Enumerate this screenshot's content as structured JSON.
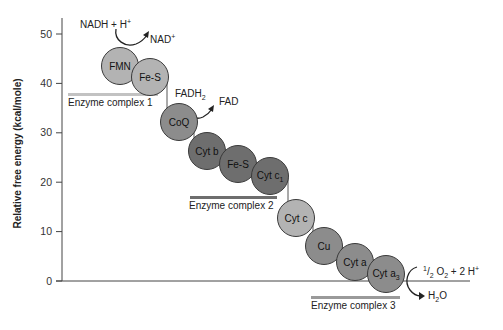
{
  "diagram": {
    "y_axis": {
      "label": "Relative free energy (kcal/mole)",
      "ticks": [
        "0",
        "10",
        "20",
        "30",
        "40",
        "50"
      ],
      "range": [
        0,
        50
      ]
    },
    "carriers": [
      {
        "id": "fmn",
        "label": "FMN",
        "shade": "light"
      },
      {
        "id": "fes1",
        "label": "Fe-S",
        "shade": "light"
      },
      {
        "id": "coq",
        "label": "CoQ",
        "shade": "mid"
      },
      {
        "id": "cytb",
        "label": "Cyt b",
        "shade": "dark"
      },
      {
        "id": "fes2",
        "label": "Fe-S",
        "shade": "dark"
      },
      {
        "id": "cytc1",
        "label": "Cyt c",
        "sub": "1",
        "shade": "dark"
      },
      {
        "id": "cytc",
        "label": "Cyt c",
        "shade": "light"
      },
      {
        "id": "cu",
        "label": "Cu",
        "shade": "mid"
      },
      {
        "id": "cyta",
        "label": "Cyt a",
        "shade": "mid"
      },
      {
        "id": "cyta3",
        "label": "Cyt a",
        "sub": "3",
        "shade": "mid"
      }
    ],
    "complexes": [
      {
        "label": "Enzyme complex 1",
        "bar_color": "#c2c2c2"
      },
      {
        "label": "Enzyme complex 2",
        "bar_color": "#6e6e6e"
      },
      {
        "label": "Enzyme complex 3",
        "bar_color": "#9a9a9a"
      }
    ],
    "reactions": {
      "nadh_in": "NADH + H",
      "nadh_in_sup": "+",
      "nad_out": "NAD",
      "nad_out_sup": "+",
      "fadh_in": "FADH",
      "fadh_in_sub": "2",
      "fad_out": "FAD",
      "o2_half_num": "1",
      "o2_half_den": "2",
      "o2_text": "O",
      "o2_sub": "2",
      "o2_rest": " + 2 H",
      "o2_sup": "+",
      "h2o_h": "H",
      "h2o_sub": "2",
      "h2o_o": "O"
    },
    "colors": {
      "light": "#b3b3b3",
      "mid": "#8c8c8c",
      "dark": "#6e6e6e",
      "axis": "#444444"
    }
  }
}
